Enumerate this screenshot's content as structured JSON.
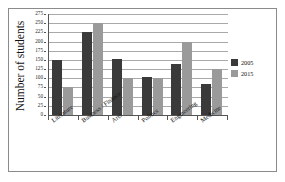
{
  "chart_data": {
    "type": "bar",
    "title": "",
    "xlabel": "",
    "ylabel": "Number of students",
    "categories": [
      "Literature",
      "Business / Finance",
      "Arts",
      "Politics",
      "Engineering",
      "Medicine"
    ],
    "series": [
      {
        "name": "2005",
        "color": "#3a3a3a",
        "values": [
          150,
          225,
          152,
          103,
          140,
          85
        ]
      },
      {
        "name": "2015",
        "color": "#9a9a9a",
        "values": [
          75,
          250,
          100,
          100,
          200,
          125
        ]
      }
    ],
    "ylim": [
      0,
      275
    ],
    "ytick_step": 25,
    "yticks": [
      0,
      25,
      50,
      75,
      100,
      125,
      150,
      175,
      200,
      225,
      250,
      275
    ],
    "ytick_labels": [
      "0",
      "25",
      "50",
      "75",
      "100",
      "125",
      "150",
      "175",
      "200",
      "225",
      "250",
      "275"
    ],
    "grid": true,
    "grid_axis": "y",
    "legend_position": "right",
    "legend_entries": [
      "2005",
      "2015"
    ]
  }
}
